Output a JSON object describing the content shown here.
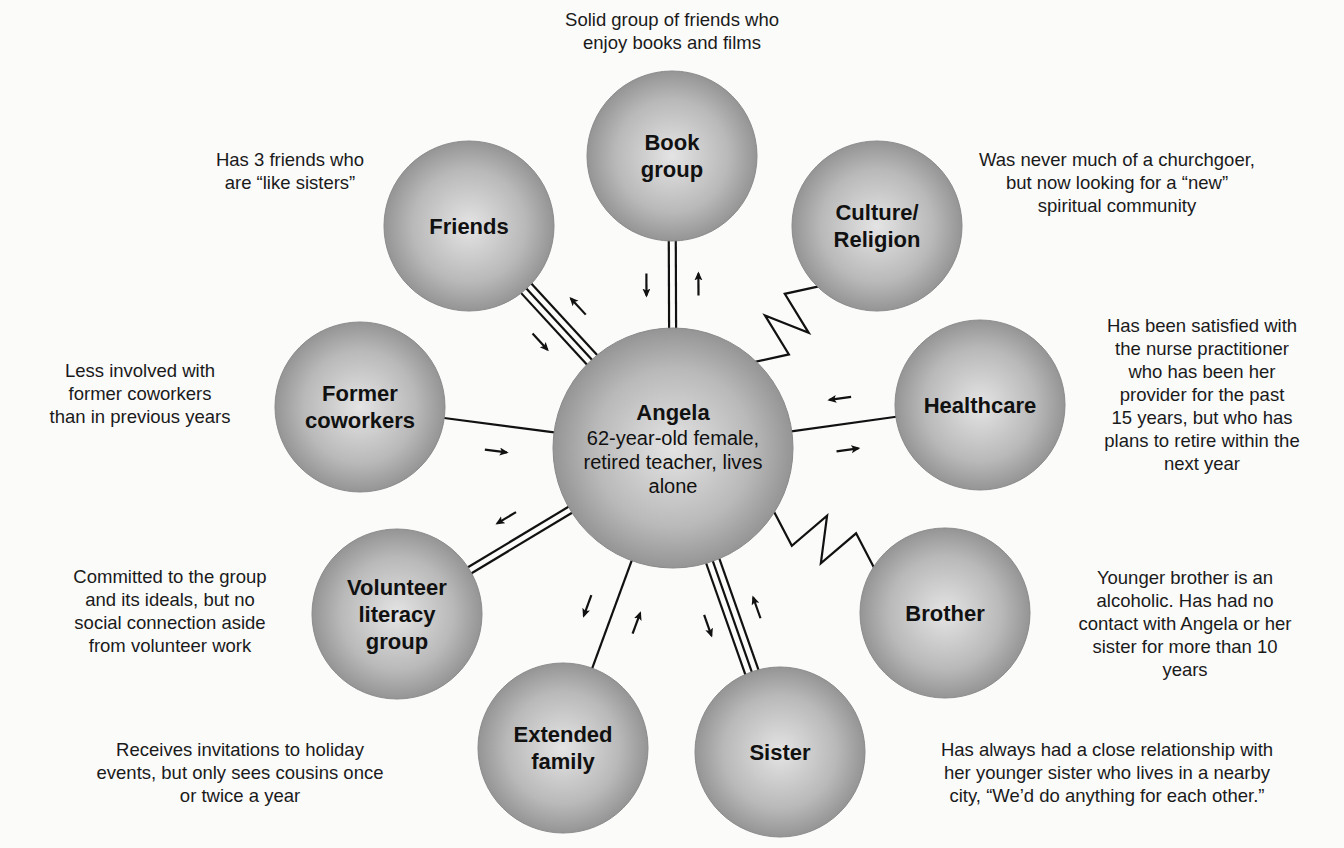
{
  "colors": {
    "background": "#fbfbfa",
    "circle_light": "#e2e2e2",
    "circle_dark": "#8e8e8e",
    "line": "#111111"
  },
  "center": {
    "title": "Angela",
    "subtitle": "62-year-old female,\nretired teacher, lives\nalone",
    "cx": 673,
    "cy": 448,
    "r": 120
  },
  "nodes": [
    {
      "id": "book-group",
      "label": "Book\ngroup",
      "cx": 672,
      "cy": 156,
      "r": 85,
      "connection": "strong-double",
      "arrows": "both",
      "note": "Solid group of friends who\nenjoy books and films",
      "note_x": 672,
      "note_y": 8,
      "note_w": 340
    },
    {
      "id": "friends",
      "label": "Friends",
      "cx": 469,
      "cy": 226,
      "r": 85,
      "connection": "very-strong-triple",
      "arrows": "both",
      "note": "Has 3 friends who\nare “like sisters”",
      "note_x": 290,
      "note_y": 148,
      "note_w": 220
    },
    {
      "id": "culture-religion",
      "label": "Culture/\nReligion",
      "cx": 877,
      "cy": 226,
      "r": 85,
      "connection": "stressful",
      "arrows": "none",
      "note": "Was never much of a churchgoer,\nbut now looking for a “new”\nspiritual community",
      "note_x": 1117,
      "note_y": 148,
      "note_w": 340
    },
    {
      "id": "former-coworkers",
      "label": "Former\ncoworkers",
      "cx": 360,
      "cy": 407,
      "r": 85,
      "connection": "weak-single",
      "arrows": "to-center",
      "note": "Less involved with\nformer coworkers\nthan in previous years",
      "note_x": 140,
      "note_y": 359,
      "note_w": 280
    },
    {
      "id": "healthcare",
      "label": "Healthcare",
      "cx": 980,
      "cy": 405,
      "r": 85,
      "connection": "weak-single",
      "arrows": "both",
      "note": "Has been satisfied with\nthe nurse practitioner\nwho has been her\nprovider for the past\n15 years, but who has\nplans to retire within the\nnext year",
      "note_x": 1202,
      "note_y": 314,
      "note_w": 280
    },
    {
      "id": "volunteer-literacy-group",
      "label": "Volunteer\nliteracy\ngroup",
      "cx": 397,
      "cy": 614,
      "r": 85,
      "connection": "strong-double",
      "arrows": "to-node",
      "note": "Committed to the group\nand its ideals, but no\nsocial connection aside\nfrom volunteer work",
      "note_x": 170,
      "note_y": 565,
      "note_w": 300
    },
    {
      "id": "brother",
      "label": "Brother",
      "cx": 945,
      "cy": 613,
      "r": 85,
      "connection": "stressful",
      "arrows": "none",
      "note": "Younger brother is an\nalcoholic. Has had no\ncontact with Angela or her\nsister for more than 10\nyears",
      "note_x": 1185,
      "note_y": 566,
      "note_w": 310
    },
    {
      "id": "extended-family",
      "label": "Extended\nfamily",
      "cx": 563,
      "cy": 748,
      "r": 85,
      "connection": "weak-single",
      "arrows": "both",
      "note": "Receives invitations to holiday\nevents, but only sees cousins once\nor twice a year",
      "note_x": 240,
      "note_y": 738,
      "note_w": 380
    },
    {
      "id": "sister",
      "label": "Sister",
      "cx": 780,
      "cy": 752,
      "r": 85,
      "connection": "very-strong-triple",
      "arrows": "both",
      "note": "Has always had a close relationship with\nher younger sister who lives in a nearby\ncity, “We’d do anything for each other.”",
      "note_x": 1107,
      "note_y": 738,
      "note_w": 470
    }
  ]
}
